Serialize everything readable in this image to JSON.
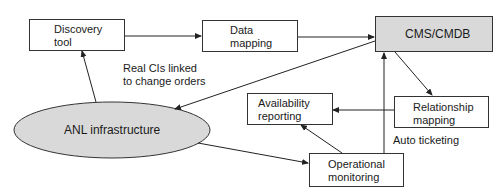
{
  "diagram": {
    "nodes": {
      "discovery_tool": {
        "line1": "Discovery",
        "line2": "tool"
      },
      "data_mapping": {
        "line1": "Data",
        "line2": "mapping"
      },
      "cms_cmdb": {
        "label": "CMS/CMDB",
        "fill": "#d9d9d9"
      },
      "anl_infrastructure": {
        "label": "ANL infrastructure",
        "fill": "#d9d9d9"
      },
      "availability_reporting": {
        "line1": "Availability",
        "line2": "reporting"
      },
      "relationship_mapping": {
        "line1": "Relationship",
        "line2": "mapping"
      },
      "operational_monitoring": {
        "line1": "Operational",
        "line2": "monitoring"
      }
    },
    "edge_labels": {
      "real_cis": {
        "line1": "Real CIs linked",
        "line2": "to change orders"
      },
      "auto_ticketing": "Auto ticketing"
    },
    "edges": [
      {
        "from": "Discovery tool",
        "to": "Data mapping"
      },
      {
        "from": "Data mapping",
        "to": "CMS/CMDB"
      },
      {
        "from": "CMS/CMDB",
        "to": "ANL infrastructure"
      },
      {
        "from": "ANL infrastructure",
        "to": "Discovery tool"
      },
      {
        "from": "CMS/CMDB",
        "to": "Relationship mapping"
      },
      {
        "from": "Relationship mapping",
        "to": "Availability reporting"
      },
      {
        "from": "ANL infrastructure",
        "to": "Operational monitoring"
      },
      {
        "from": "Operational monitoring",
        "to": "Availability reporting"
      },
      {
        "from": "Operational monitoring",
        "to": "CMS/CMDB",
        "label": "Auto ticketing"
      }
    ]
  }
}
